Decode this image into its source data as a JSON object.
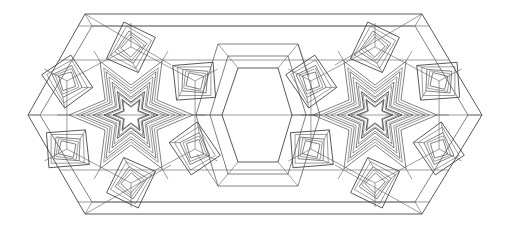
{
  "canvas": {
    "width": 507,
    "height": 229,
    "background_color": "#ffffff",
    "stroke_color": "#3b3b3b",
    "stroke_color_secondary": "#4a4a4a",
    "stroke_color_faint": "#5c5c5c",
    "stroke_width": 0.85
  },
  "artwork": {
    "kind": "geometric-line-drawing",
    "style": "islamic-girih-rosette-tiling",
    "description": "Black-and-white line drawing of two six-fold star rosettes flanking an empty hexagonal center, enclosed in an elongated hexagonal outer envelope",
    "symmetry": "bilateral horizontal and vertical mirror symmetry",
    "fill": "none",
    "bounds": {
      "left": 28,
      "top": 14,
      "right": 482,
      "bottom": 214
    }
  },
  "outer_envelope": {
    "name": "elongated-hexagon-border",
    "points": [
      [
        85,
        14
      ],
      [
        422,
        14
      ],
      [
        482,
        115
      ],
      [
        422,
        214
      ],
      [
        85,
        214
      ],
      [
        28,
        115
      ]
    ],
    "inner_offset_points": [
      [
        92,
        26
      ],
      [
        415,
        26
      ],
      [
        468,
        115
      ],
      [
        415,
        202
      ],
      [
        92,
        202
      ],
      [
        40,
        115
      ]
    ]
  },
  "central_void": {
    "name": "central-hexagon-void",
    "points": [
      [
        238,
        68
      ],
      [
        278,
        68
      ],
      [
        292,
        115
      ],
      [
        278,
        162
      ],
      [
        238,
        162
      ],
      [
        222,
        115
      ]
    ],
    "outer_points": [
      [
        228,
        56
      ],
      [
        288,
        56
      ],
      [
        306,
        115
      ],
      [
        288,
        174
      ],
      [
        228,
        174
      ],
      [
        210,
        115
      ]
    ],
    "ring_points": [
      [
        218,
        44
      ],
      [
        298,
        44
      ],
      [
        320,
        115
      ],
      [
        298,
        186
      ],
      [
        218,
        186
      ],
      [
        196,
        115
      ]
    ]
  },
  "rosettes": [
    {
      "id": "rosette-left",
      "center": [
        131,
        115
      ],
      "points": 6,
      "rotation_deg": 0,
      "star_layers": [
        {
          "outer_r": 18,
          "inner_r": 8.5
        },
        {
          "outer_r": 27,
          "inner_r": 13
        },
        {
          "outer_r": 38,
          "inner_r": 18
        },
        {
          "outer_r": 50,
          "inner_r": 24
        },
        {
          "outer_r": 62,
          "inner_r": 30
        }
      ],
      "module_ring_radius": 74,
      "module_count": 6,
      "module_size": 40
    },
    {
      "id": "rosette-right",
      "center": [
        375,
        115
      ],
      "points": 6,
      "rotation_deg": 0,
      "star_layers": [
        {
          "outer_r": 18,
          "inner_r": 8.5
        },
        {
          "outer_r": 27,
          "inner_r": 13
        },
        {
          "outer_r": 38,
          "inner_r": 18
        },
        {
          "outer_r": 50,
          "inner_r": 24
        },
        {
          "outer_r": 62,
          "inner_r": 30
        }
      ],
      "module_ring_radius": 74,
      "module_count": 6,
      "module_size": 40
    }
  ],
  "spiral_square_module": {
    "name": "nested-rotated-square-spiral",
    "nesting_levels": 3,
    "scale_step": 0.62,
    "rotation_step_deg": 9,
    "description": "Each petal of the rosette is a set of nested, slightly rotated quadrilaterals creating a spiral band effect"
  },
  "connector_bands": {
    "name": "strapwork-connectors",
    "description": "Straight band pairs linking the two rosettes along the horizontal mid-line and upper/lower chords",
    "horizontal_chords_y": [
      26,
      60,
      115,
      170,
      202
    ]
  },
  "meta": {
    "title": "",
    "caption": "",
    "labels": []
  }
}
